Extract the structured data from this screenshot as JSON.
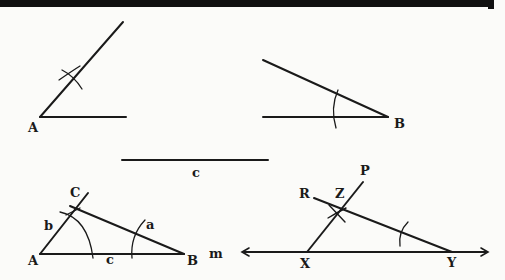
{
  "colors": {
    "ink": "#1a1a1a",
    "paper": "#fbfbf9",
    "band": "#111111"
  },
  "figure1": {
    "vertex_label": "A"
  },
  "figure2": {
    "vertex_label": "B"
  },
  "segment": {
    "label": "c"
  },
  "triangle": {
    "vertex_a": "A",
    "vertex_b": "B",
    "vertex_c": "C",
    "side_a": "a",
    "side_b": "b",
    "side_c": "c",
    "line_m": "m"
  },
  "figure4": {
    "point_x": "X",
    "point_y": "Y",
    "point_z": "Z",
    "point_p": "P",
    "point_r": "R"
  }
}
